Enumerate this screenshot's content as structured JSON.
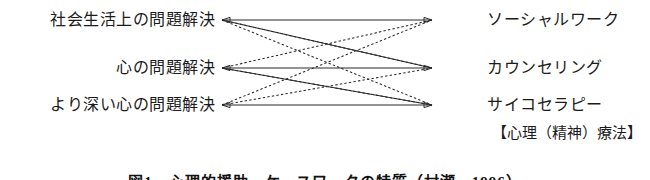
{
  "figure": {
    "title_caption": "図1　心理的援助、ケースワークの特質（村瀬　1996）",
    "left_nodes": [
      {
        "id": "social-life-problem",
        "label": "社会生活上の問題解決",
        "y": 20
      },
      {
        "id": "mind-problem",
        "label": "心の問題解決",
        "y": 68
      },
      {
        "id": "deeper-mind-problem",
        "label": "より深い心の問題解決",
        "y": 105
      }
    ],
    "right_nodes": [
      {
        "id": "social-work",
        "label": "ソーシャルワーク",
        "y": 20
      },
      {
        "id": "counseling",
        "label": "カウンセリング",
        "y": 68
      },
      {
        "id": "psychotherapy",
        "label": "サイコセラピー",
        "y": 105
      }
    ],
    "group_bracket": {
      "label": "【心理（精神）療法】",
      "y": 133
    },
    "caption_y": 170,
    "edges": [
      {
        "from": 0,
        "to": 0,
        "style": "solid"
      },
      {
        "from": 0,
        "to": 1,
        "style": "solid"
      },
      {
        "from": 1,
        "to": 1,
        "style": "solid"
      },
      {
        "from": 1,
        "to": 2,
        "style": "solid"
      },
      {
        "from": 2,
        "to": 2,
        "style": "solid"
      },
      {
        "from": 0,
        "to": 1,
        "style": "dashed"
      },
      {
        "from": 0,
        "to": 2,
        "style": "dashed"
      },
      {
        "from": 1,
        "to": 0,
        "style": "dashed"
      },
      {
        "from": 1,
        "to": 2,
        "style": "dashed"
      },
      {
        "from": 2,
        "to": 0,
        "style": "dashed"
      },
      {
        "from": 2,
        "to": 1,
        "style": "dashed"
      }
    ],
    "geometry": {
      "left_x": 222,
      "right_x": 432,
      "arrow_size": 6
    },
    "colors": {
      "line": "#2a2a2a",
      "text": "#1b1b1b",
      "background": "#ffffff"
    }
  }
}
